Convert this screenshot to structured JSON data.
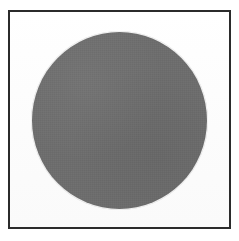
{
  "figure": {
    "caption": "",
    "background_color": "#ffffff",
    "border_color": "#2b2b2b",
    "border_width_px": 2,
    "panel_color": "#fdfdfd",
    "panel": {
      "x": 8,
      "y": 10,
      "width": 223,
      "height": 219
    }
  },
  "shape": {
    "kind": "circle",
    "label": "",
    "fill_color": "#6e6e6e",
    "center_x": 119,
    "center_y": 119,
    "diameter_px": 175,
    "radius_px": 87
  }
}
